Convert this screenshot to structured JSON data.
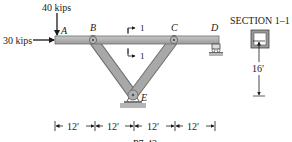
{
  "figure": {
    "loads": {
      "vertical": "40 kips",
      "horizontal": "30 kips"
    },
    "points": {
      "A": "A",
      "B": "B",
      "C": "C",
      "D": "D",
      "E": "E"
    },
    "section_marks": {
      "top": "1",
      "bottom": "1"
    },
    "section_title": "SECTION 1–1",
    "height_dimension": "16′",
    "span_dimensions": [
      "12′",
      "12′",
      "12′",
      "12′"
    ],
    "caption_fragment": "P7-43"
  },
  "colors": {
    "member_fill": "#a8a8a8",
    "member_stroke": "#6e6e6e",
    "ground": "#b5b5b5",
    "ink": "#1a1a1a"
  }
}
